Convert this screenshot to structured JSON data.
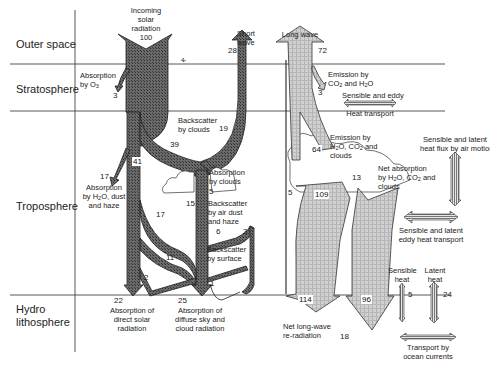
{
  "zones": [
    {
      "label": "Outer space"
    },
    {
      "label": "Stratosphere"
    },
    {
      "label": "Troposphere"
    },
    {
      "label": "Hydro lithosphere",
      "line1": "Hydro",
      "line2": "lithosphere"
    }
  ],
  "solar": {
    "incoming": {
      "line1": "Incoming",
      "line2": "solar",
      "line3": "radiation",
      "value": "100"
    },
    "short_wave": {
      "line1": "Short",
      "line2": "wave",
      "value": "28"
    },
    "ozone_absorption": {
      "line1": "Absorption",
      "line2": "by O",
      "sub": "3",
      "value": "3"
    },
    "backscatter_clouds": {
      "line1": "Backscatter",
      "line2": "by clouds",
      "value": "19"
    },
    "cloud_branch_value": "39",
    "direct_value": "41",
    "haze_absorption": {
      "line1": "Absorption",
      "line2a": "by H",
      "line2b": "O, dust",
      "line3": "and haze",
      "value": "17"
    },
    "absorption_clouds": {
      "line1": "Absorption",
      "line2": "by clouds",
      "value": "5"
    },
    "diffuse_value_15": "15",
    "diffuse_value_17": "17",
    "backscatter_air": {
      "line1": "Backscatter",
      "line2": "by air dust",
      "line3": "and haze",
      "value_left": "6",
      "value_right": "3"
    },
    "backscatter_surface": {
      "line1": "Backscatter",
      "line2": "by surface",
      "value": "1"
    },
    "value_11": "11",
    "value_2": "2",
    "direct_absorption": {
      "line1": "Absorption of",
      "line2": "direct solar",
      "line3": "radiation",
      "value": "22"
    },
    "diffuse_absorption": {
      "line1": "Absorption of",
      "line2": "diffuse sky and",
      "line3": "cloud radiation",
      "value": "25"
    },
    "small_mark": "4"
  },
  "longwave": {
    "label": "Long wave",
    "value": "72",
    "emission_co2": {
      "line1": "Emission by",
      "line2a": "CO",
      "line2b": " and H",
      "line2c": "O",
      "value": "3"
    },
    "emission_h2o": {
      "line1": "Emission by",
      "line2a": "H",
      "line2b": "O, CO",
      "line2c": " and",
      "line3": "clouds",
      "value": "64"
    },
    "net_absorption": {
      "line1": "Net absorption",
      "line2a": "by H",
      "line2b": "O, CO",
      "line2c": " and",
      "line3": "clouds",
      "value": "13"
    },
    "value_5": "5",
    "value_109": "109",
    "value_114": "114",
    "value_96": "96",
    "net_reradiation": {
      "line1": "Net long-wave",
      "line2": "re-radiation",
      "value": "18"
    }
  },
  "transport": {
    "strat_heat": {
      "line1": "Sensible and eddy",
      "line2": "Heat transport"
    },
    "air_motion": {
      "line1": "Sensible and latent",
      "line2": "heat flux by air motion"
    },
    "eddy": {
      "line1": "Sensible and latent",
      "line2": "eddy heat transport"
    },
    "sensible": {
      "line1": "Sensible",
      "line2": "heat",
      "value": "5"
    },
    "latent": {
      "line1": "Latent",
      "line2": "heat",
      "value": "24"
    },
    "ocean": {
      "line1": "Transport by",
      "line2": "ocean currents"
    }
  },
  "colors": {
    "shortwave_fill": "#555555",
    "longwave_fill": "#c4c4c4",
    "line": "#333333",
    "background": "#ffffff"
  }
}
